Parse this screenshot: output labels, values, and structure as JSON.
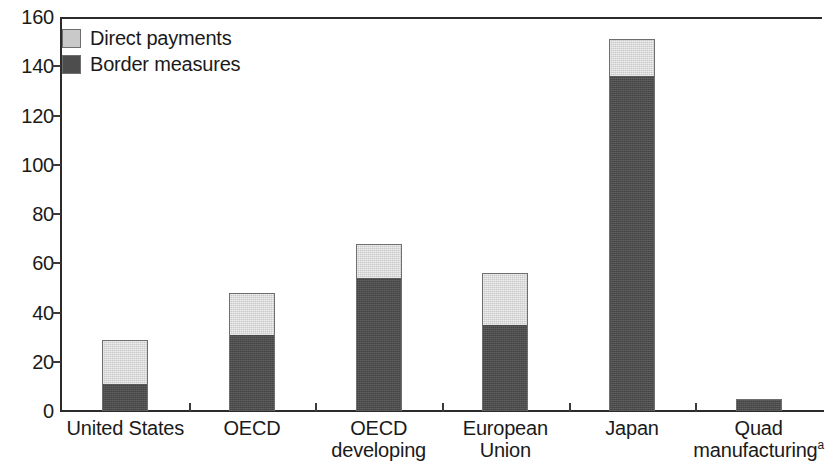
{
  "chart_data": {
    "type": "bar",
    "subtype": "stacked-vertical",
    "title": "",
    "xlabel": "",
    "ylabel": "",
    "ylim": [
      0,
      160
    ],
    "y_ticks": [
      0,
      20,
      40,
      60,
      80,
      100,
      120,
      140,
      160
    ],
    "grid": false,
    "legend_position": "top-left",
    "categories": [
      "United States",
      "OECD",
      "OECD developing",
      "European Union",
      "Japan",
      "Quad manufacturing"
    ],
    "category_labels": [
      {
        "line1": "United States",
        "line2": "",
        "superscript": ""
      },
      {
        "line1": "OECD",
        "line2": "",
        "superscript": ""
      },
      {
        "line1": "OECD",
        "line2": "developing",
        "superscript": ""
      },
      {
        "line1": "European",
        "line2": "Union",
        "superscript": ""
      },
      {
        "line1": "Japan",
        "line2": "",
        "superscript": ""
      },
      {
        "line1": "Quad",
        "line2": "manufacturing",
        "superscript": "a"
      }
    ],
    "series": [
      {
        "name": "Border measures",
        "color": "#4d4d4d",
        "values": [
          11,
          31,
          54,
          35,
          136,
          5
        ]
      },
      {
        "name": "Direct payments",
        "color": "#c9c9c9",
        "values": [
          18,
          17,
          14,
          21,
          15,
          0
        ]
      }
    ],
    "totals": [
      29,
      48,
      68,
      56,
      151,
      5
    ]
  },
  "legend": {
    "items": [
      {
        "label": "Direct payments",
        "color": "#c9c9c9"
      },
      {
        "label": "Border measures",
        "color": "#4d4d4d"
      }
    ]
  },
  "axis": {
    "y_tick_labels": [
      "160",
      "140",
      "120",
      "100",
      "80",
      "60",
      "40",
      "20",
      "0"
    ]
  }
}
